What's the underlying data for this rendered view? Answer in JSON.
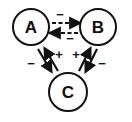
{
  "diagram": {
    "type": "signed-interaction-network",
    "nodes": [
      {
        "id": "A",
        "label": "A",
        "cx": 31,
        "cy": 27,
        "r": 18
      },
      {
        "id": "B",
        "label": "B",
        "cx": 98,
        "cy": 27,
        "r": 18
      },
      {
        "id": "C",
        "label": "C",
        "cx": 68,
        "cy": 92,
        "r": 19
      }
    ],
    "edges": [
      {
        "from": "A",
        "to": "B",
        "sign": "−",
        "style": "dashed"
      },
      {
        "from": "B",
        "to": "A",
        "sign": "−",
        "style": "dashed"
      },
      {
        "from": "A",
        "to": "C",
        "sign": "−",
        "style": "solid"
      },
      {
        "from": "C",
        "to": "A",
        "sign": "+",
        "style": "solid"
      },
      {
        "from": "C",
        "to": "B",
        "sign": "+",
        "style": "solid"
      },
      {
        "from": "B",
        "to": "C",
        "sign": "−",
        "style": "solid"
      }
    ]
  },
  "labels": {
    "node_a": "A",
    "node_b": "B",
    "node_c": "C",
    "sign_ab": "−",
    "sign_ba": "−",
    "sign_ac": "−",
    "sign_ca": "+",
    "sign_cb": "+",
    "sign_bc": "−"
  }
}
